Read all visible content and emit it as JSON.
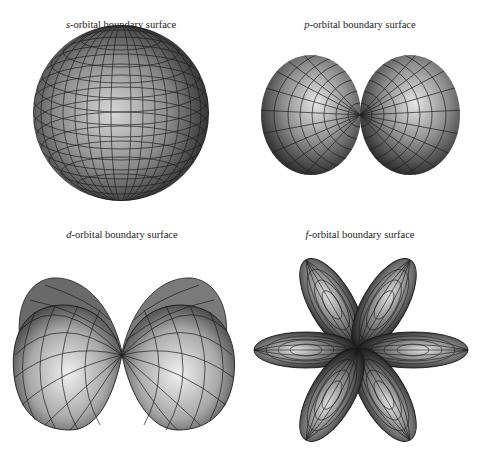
{
  "panels": [
    {
      "id": "s",
      "letter": "s",
      "suffix": "-orbital boundary surface",
      "shape": "sphere",
      "lobes": 1
    },
    {
      "id": "p",
      "letter": "p",
      "suffix": "-orbital boundary surface",
      "shape": "two ellipsoidal lobes (horizontal)",
      "lobes": 2
    },
    {
      "id": "d",
      "letter": "d",
      "suffix": "-orbital boundary surface",
      "shape": "two double-lobed surfaces (horizontal)",
      "lobes": 2
    },
    {
      "id": "f",
      "letter": "f",
      "suffix": "-orbital boundary surface",
      "shape": "six petal lobes (rosette)",
      "lobes": 6
    }
  ],
  "colors": {
    "background": "#ffffff",
    "mesh": "#1a1a1a",
    "highlight": "#e8e8e8",
    "shadow": "#2a2a2a",
    "text": "#222222"
  }
}
